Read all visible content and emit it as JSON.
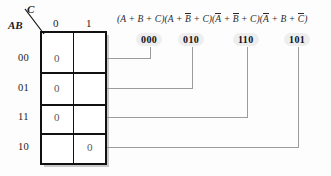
{
  "diagram": {
    "title_expression": {
      "parts": [
        {
          "text": "(A + B + C)",
          "bars": []
        },
        {
          "text": "(A + B̅ + C)",
          "bars": [
            "B"
          ]
        },
        {
          "text": "(A̅ + B̅ + C)",
          "bars": [
            "A",
            "B"
          ]
        },
        {
          "text": "(A̅ + B + C̅)",
          "bars": [
            "A",
            "C"
          ]
        }
      ],
      "plain": "(A + B + C)(A + B' + C)(A' + B' + C)(A' + B + C')"
    },
    "kmap": {
      "col_variable": "C",
      "row_variable": "AB",
      "column_headers": [
        "0",
        "1"
      ],
      "row_headers": [
        "00",
        "01",
        "11",
        "10"
      ],
      "cells": [
        {
          "row": "00",
          "col": "0",
          "value": "0"
        },
        {
          "row": "00",
          "col": "1",
          "value": ""
        },
        {
          "row": "01",
          "col": "0",
          "value": "0"
        },
        {
          "row": "01",
          "col": "1",
          "value": ""
        },
        {
          "row": "11",
          "col": "0",
          "value": "0"
        },
        {
          "row": "11",
          "col": "1",
          "value": ""
        },
        {
          "row": "10",
          "col": "0",
          "value": ""
        },
        {
          "row": "10",
          "col": "1",
          "value": "0"
        }
      ]
    },
    "maxterm_labels": [
      {
        "id": "mt-000",
        "text": "000",
        "target_row": "00",
        "target_col": "0"
      },
      {
        "id": "mt-010",
        "text": "010",
        "target_row": "01",
        "target_col": "0"
      },
      {
        "id": "mt-110",
        "text": "110",
        "target_row": "11",
        "target_col": "0"
      },
      {
        "id": "mt-101",
        "text": "101",
        "target_row": "10",
        "target_col": "1"
      }
    ],
    "colors": {
      "grid_line": "#111111",
      "leader_line": "#9a9a9a",
      "shadow": "#c8c8c8",
      "label_pill": "#eeeeee",
      "background": "#fdfdfd"
    }
  }
}
